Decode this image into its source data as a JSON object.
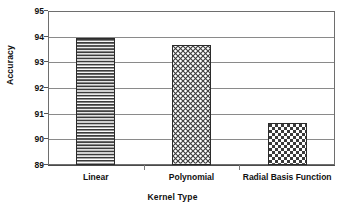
{
  "chart_data": {
    "type": "bar",
    "title": "",
    "xlabel": "Kernel Type",
    "ylabel": "Accuracy",
    "categories": [
      "Linear",
      "Polynomial",
      "Radial Basis Function"
    ],
    "values": [
      93.93,
      93.66,
      90.63
    ],
    "ylim": [
      89,
      95
    ],
    "yticks": [
      89,
      90,
      91,
      92,
      93,
      94,
      95
    ],
    "ytick_labels": [
      "89",
      "90",
      "91",
      "92",
      "93",
      "94",
      "95"
    ],
    "grid": true,
    "legend": "none",
    "series": [
      {
        "name": "Accuracy",
        "values": [
          93.93,
          93.66,
          90.63
        ],
        "patterns": [
          "horizontal-lines",
          "diagonal-crosshatch",
          "checkerboard"
        ]
      }
    ],
    "colors": {
      "bar_fill": "#ffffff",
      "bar_outline": "#2b2b2b",
      "pattern": "#3b3b3b",
      "gridline": "#8a8a8a",
      "frame": "#6e6e6e",
      "text": "#111111",
      "background": "#ffffff"
    }
  }
}
